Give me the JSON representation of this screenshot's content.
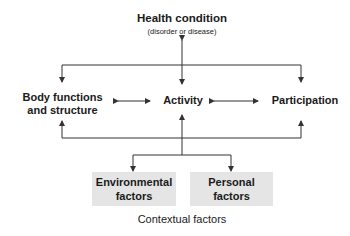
{
  "diagram": {
    "title": "Health condition",
    "subtitle": "(disorder or disease)",
    "nodes": {
      "body_functions": [
        "Body functions",
        "and structure"
      ],
      "activity": "Activity",
      "participation": "Participation",
      "environmental": [
        "Environmental",
        "factors"
      ],
      "personal": [
        "Personal",
        "factors"
      ]
    },
    "group_label": "Contextual factors",
    "colors": {
      "line": "#333333",
      "box_fill": "#e5e5e5",
      "text": "#1a1a1a"
    }
  }
}
